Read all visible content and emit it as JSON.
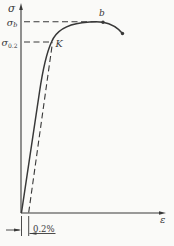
{
  "figure": {
    "type": "stress-strain-diagram",
    "colors": {
      "ink": "#383838",
      "paper": "#fafaf8"
    },
    "axes": {
      "y_label": "σ",
      "x_label": "ε"
    },
    "labels": {
      "sigma_b_base": "σ",
      "sigma_b_sub": "b",
      "sigma_02_base": "σ",
      "sigma_02_sub": "0.2",
      "point_b": "b",
      "point_k": "K",
      "offset_dimension": "0.2%"
    },
    "annotations": {
      "ultimate_strength_line": "dashed horizontal line from σb to peak point b",
      "yield_line": "dashed horizontal line from σ0.2 to point K",
      "offset_construction": "dashed line parallel to elastic slope from 0.2% strain to K",
      "fracture_point": "dot at descending end of curve after b"
    }
  }
}
